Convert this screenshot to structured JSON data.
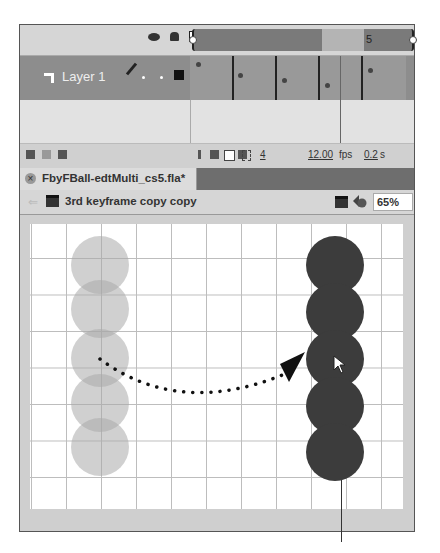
{
  "timeline": {
    "header_icons": [
      "eye-icon",
      "lock-icon",
      "outline-icon"
    ],
    "current_frame_label": "5",
    "layer": {
      "name": "Layer 1"
    },
    "keyframes": [
      1,
      2,
      3,
      4,
      5
    ],
    "footer": {
      "current_frame": "4",
      "fps": "12.00",
      "fps_unit": "fps",
      "elapsed": "0.2",
      "elapsed_unit": "s"
    }
  },
  "document": {
    "tab_title": "FbyFBall-edtMulti_cs5.fla*",
    "close_glyph": "×"
  },
  "edit_bar": {
    "back_glyph": "⇐",
    "scene_label": "3rd keyframe copy copy",
    "zoom_value": "65%"
  },
  "stage": {
    "onion_skin_balls": 5,
    "current_balls": 5,
    "arrow_annotation": "dotted arrow from onion-skinned frames to current frames"
  },
  "colors": {
    "layer_row": "#8d8d8d",
    "solid_ball": "#3c3c3c",
    "ghost_ball": "#aaaaaa",
    "grid": "#bdbdbd"
  }
}
